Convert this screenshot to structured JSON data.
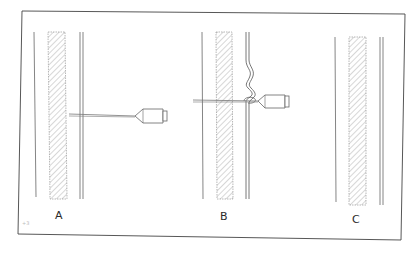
{
  "figure": {
    "panels": [
      {
        "id": "A",
        "label": "A",
        "description": "Needle inserted through vessel wall"
      },
      {
        "id": "B",
        "label": "B",
        "description": "Needle with coiled vessel wall wrapped around shaft"
      },
      {
        "id": "C",
        "label": "C",
        "description": "Vessel walls after needle withdrawal"
      }
    ],
    "margin_mark": "+3",
    "colors": {
      "ink": "#555555",
      "frame": "#444444",
      "hatch": "#8a8a8a",
      "background": "#ffffff"
    }
  }
}
